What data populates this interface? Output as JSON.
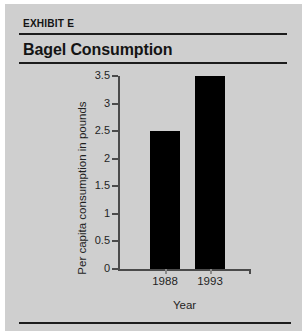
{
  "exhibit": {
    "tag": "EXHIBIT E",
    "title": "Bagel Consumption"
  },
  "colors": {
    "panel_background": "#cfcfcf",
    "bar": "#000000",
    "axis": "#4a4a4a",
    "rule": "#1d1d1d",
    "text": "#141414"
  },
  "chart_data": {
    "type": "bar",
    "title": "Bagel Consumption",
    "categories": [
      "1988",
      "1993"
    ],
    "values": [
      2.5,
      3.5
    ],
    "xlabel": "Year",
    "ylabel": "Per capita consumption in pounds",
    "ylim": [
      0,
      3.5
    ],
    "ytick_labels": [
      "0",
      "0.5",
      "1",
      "1.5",
      "2",
      "2.5",
      "3",
      "3.5"
    ],
    "ytick_values": [
      0,
      0.5,
      1,
      1.5,
      2,
      2.5,
      3,
      3.5
    ],
    "grid": false,
    "legend": null
  }
}
